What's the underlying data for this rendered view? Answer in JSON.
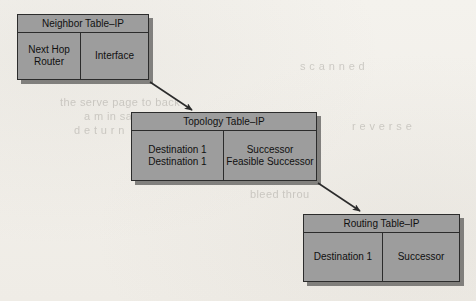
{
  "diagram": {
    "type": "flow-diagram",
    "background_color": "#f3f1ec",
    "box_fill_color": "#9d9d9d",
    "box_border_color": "#2c2c2c",
    "tables": [
      {
        "id": "neighbor",
        "title": "Neighbor Table–IP",
        "cells": [
          {
            "lines": [
              "Next Hop",
              "Router"
            ]
          },
          {
            "lines": [
              "Interface"
            ]
          }
        ]
      },
      {
        "id": "topology",
        "title": "Topology Table–IP",
        "cells": [
          {
            "lines": [
              "Destination 1",
              "Destination 1"
            ]
          },
          {
            "lines": [
              "Successor",
              "Feasible Successor"
            ]
          }
        ]
      },
      {
        "id": "routing",
        "title": "Routing Table–IP",
        "cells": [
          {
            "lines": [
              "Destination 1"
            ]
          },
          {
            "lines": [
              "Successor"
            ]
          }
        ]
      }
    ],
    "arrows": [
      {
        "id": "neighbor-to-topology",
        "from": "neighbor",
        "to": "topology"
      },
      {
        "id": "topology-to-routing",
        "from": "topology",
        "to": "routing"
      }
    ],
    "artifacts": {
      "note": "faint bleed-through text from reverse of scanned page",
      "ghosts": [
        {
          "text": "the serve page to back",
          "left": 60,
          "top": 96
        },
        {
          "text": "a m in  sa r t",
          "left": 84,
          "top": 110
        },
        {
          "text": "d e t u r n",
          "left": 74,
          "top": 124
        },
        {
          "text": "bleed  throu",
          "left": 250,
          "top": 188
        },
        {
          "text": "s c a n n e d",
          "left": 300,
          "top": 60
        },
        {
          "text": "r e v e r s e",
          "left": 352,
          "top": 120
        }
      ]
    }
  }
}
